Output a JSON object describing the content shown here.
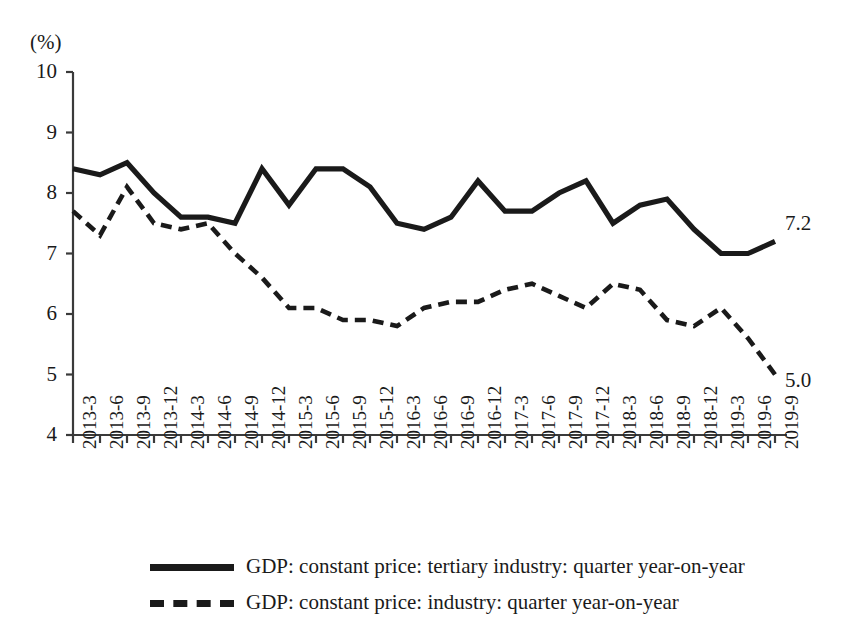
{
  "chart_data": {
    "type": "line",
    "title": "",
    "xlabel": "",
    "ylabel": "(%)",
    "ylim": [
      4,
      10
    ],
    "yticks": [
      10,
      9,
      8,
      7,
      6,
      5,
      4
    ],
    "grid": false,
    "legend_position": "bottom",
    "categories": [
      "2013-3",
      "2013-6",
      "2013-9",
      "2013-12",
      "2014-3",
      "2014-6",
      "2014-9",
      "2014-12",
      "2015-3",
      "2015-6",
      "2015-9",
      "2015-12",
      "2016-3",
      "2016-6",
      "2016-9",
      "2016-12",
      "2017-3",
      "2017-6",
      "2017-9",
      "2017-12",
      "2018-3",
      "2018-6",
      "2018-9",
      "2018-12",
      "2019-3",
      "2019-6",
      "2019-9"
    ],
    "series": [
      {
        "name": "GDP: constant price: tertiary industry: quarter year-on-year",
        "style": "solid",
        "color": "#1a1a1a",
        "end_label": "7.2",
        "values": [
          8.4,
          8.3,
          8.5,
          8.0,
          7.6,
          7.6,
          7.5,
          8.4,
          7.8,
          8.4,
          8.4,
          8.1,
          7.5,
          7.4,
          7.6,
          8.2,
          7.7,
          7.7,
          8.0,
          8.2,
          7.5,
          7.8,
          7.9,
          7.4,
          7.0,
          7.0,
          7.2
        ]
      },
      {
        "name": "GDP: constant price: industry: quarter year-on-year",
        "style": "dashed",
        "color": "#1a1a1a",
        "end_label": "5.0",
        "values": [
          7.7,
          7.3,
          8.1,
          7.5,
          7.4,
          7.5,
          7.0,
          6.6,
          6.1,
          6.1,
          5.9,
          5.9,
          5.8,
          6.1,
          6.2,
          6.2,
          6.4,
          6.5,
          6.3,
          6.1,
          6.5,
          6.4,
          5.9,
          5.8,
          6.1,
          5.6,
          5.0
        ]
      }
    ]
  },
  "legend": {
    "items": [
      {
        "label": "GDP: constant price: tertiary industry: quarter year-on-year",
        "style": "solid"
      },
      {
        "label": "GDP: constant price: industry: quarter year-on-year",
        "style": "dashed"
      }
    ]
  }
}
